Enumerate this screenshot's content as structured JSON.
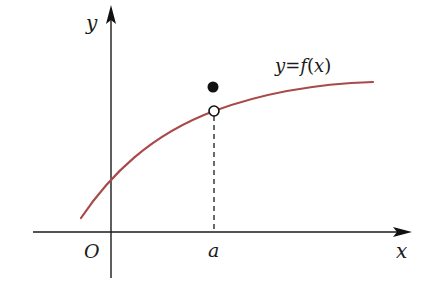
{
  "diagram": {
    "type": "function-graph",
    "axes": {
      "x_label": "x",
      "y_label": "y",
      "origin_label": "O"
    },
    "curve": {
      "label": "y=f(x)",
      "label_parts": [
        "y",
        "=",
        "f",
        "(",
        "x",
        ")"
      ],
      "color": "#a84a4a"
    },
    "points": {
      "a_label": "a",
      "open_circle": "value of curve at x=a (excluded)",
      "filled_point": "f(a) defined above the curve"
    },
    "guide_line": "dashed vertical from x-axis at a to open circle",
    "colors": {
      "axis": "#1a1a1a",
      "curve": "#a84a4a",
      "point": "#111111"
    }
  }
}
